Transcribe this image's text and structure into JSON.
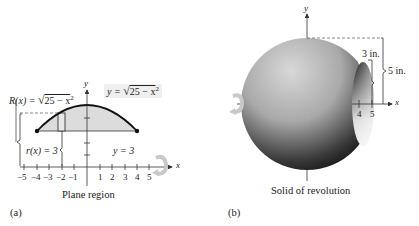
{
  "panel_a": {
    "tag": "(a)",
    "caption": "Plane region",
    "axis_x_label": "x",
    "axis_y_label": "y",
    "x_ticks": [
      "−5",
      "−4",
      "−3",
      "−2",
      "−1",
      "1",
      "2",
      "3",
      "4",
      "5"
    ],
    "curve_label": "y = √(25 − x²)",
    "curve_label_prefix": "y = ",
    "curve_label_radicand": "25 − x",
    "outer_radius_prefix": "R(x) = ",
    "outer_radius_radicand": "25 − x",
    "inner_radius_label": "r(x) = 3",
    "line_label": "y = 3",
    "colors": {
      "region_fill": "#dcdcdc",
      "curve": "#111111",
      "rotation_arrow": "#c8c8c8"
    }
  },
  "panel_b": {
    "tag": "(b)",
    "caption": "Solid of revolution",
    "axis_x_label": "x",
    "axis_y_label": "y",
    "x_ticks": [
      "4",
      "5"
    ],
    "inner_dim_label": "3 in.",
    "outer_dim_label": "5 in.",
    "colors": {
      "sphere_light": "#c9c9c9",
      "sphere_dark": "#0e0e0e",
      "rotation_arrow": "#c8c8c8"
    }
  }
}
